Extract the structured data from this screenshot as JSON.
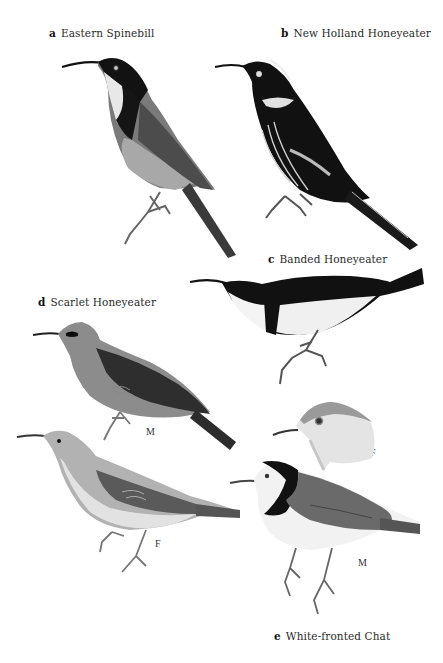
{
  "plate": {
    "species": [
      {
        "letter": "a",
        "name": "Eastern Spinebill"
      },
      {
        "letter": "b",
        "name": "New Holland Honeyeater"
      },
      {
        "letter": "c",
        "name": "Banded Honeyeater"
      },
      {
        "letter": "d",
        "name": "Scarlet Honeyeater"
      },
      {
        "letter": "e",
        "name": "White-fronted Chat"
      }
    ],
    "sex_labels": {
      "scarlet_male": "M",
      "scarlet_female": "F",
      "chat_female_head": "F",
      "chat_male": "M"
    }
  },
  "colors": {
    "background": "#ffffff",
    "black_plumage": "#111111",
    "dark_grey": "#3a3a3a",
    "mid_grey": "#6f6f6f",
    "light_grey": "#9a9a9a",
    "pale": "#e6e6e6"
  }
}
